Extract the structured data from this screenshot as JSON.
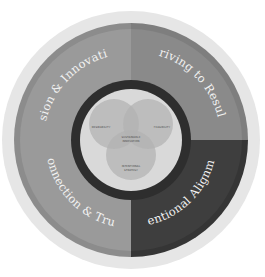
{
  "diagram": {
    "colors": {
      "background": "#ffffff",
      "outer_halo": "#e6e6e6",
      "quadrant_light": "#9a9a9a",
      "quadrant_light_band": "#8c8c8c",
      "quadrant_mid": "#8a8a8a",
      "quadrant_mid_band": "#7e7e7e",
      "quadrant_dark": "#3e3e3e",
      "quadrant_dark_band": "#353535",
      "inner_gap": "#b5b5b5",
      "dark_ring": "#2e2e2e",
      "center_disc": "#d9d9d9",
      "venn_fill": "#b3b3b3",
      "label_text": "#f2f2f2"
    },
    "quadrants": [
      {
        "position": "top-left",
        "label": "Vision & Innovation"
      },
      {
        "position": "top-right",
        "label": "Driving to Results"
      },
      {
        "position": "bottom-right",
        "label": "Intentional Alignment"
      },
      {
        "position": "bottom-left",
        "label": "Connection & Trust"
      }
    ],
    "venn": {
      "circles": [
        {
          "position": "left",
          "label": "DESIRABILITY"
        },
        {
          "position": "right",
          "label": "FEASIBILITY"
        },
        {
          "position": "bottom",
          "label": "INTENTIONAL",
          "label2": "STRATEGY"
        }
      ],
      "center_label": "SUSTAINABLE",
      "center_label2": "INNOVATION"
    }
  }
}
